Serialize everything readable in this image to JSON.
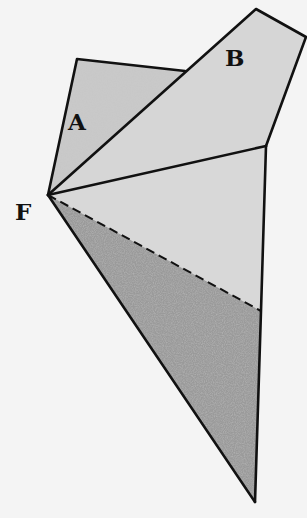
{
  "diagram": {
    "labels": {
      "A": "A",
      "B": "B",
      "F": "F"
    },
    "regions": [
      {
        "name": "region-A",
        "label": "A",
        "shading": "medium-gray"
      },
      {
        "name": "region-B",
        "label": "B",
        "shading": "light-gray"
      },
      {
        "name": "region-middle",
        "label": "",
        "shading": "light-gray"
      },
      {
        "name": "region-bottom",
        "label": "",
        "shading": "dark-stippled"
      }
    ],
    "lines": {
      "dashed_edge": "fold line from F to right edge"
    }
  },
  "colors": {
    "background": "#f4f4f4",
    "light_fill": "#d6d6d6",
    "medium_fill": "#c6c6c6",
    "dark_fill": "#8e8e8e",
    "stroke": "#111111"
  }
}
